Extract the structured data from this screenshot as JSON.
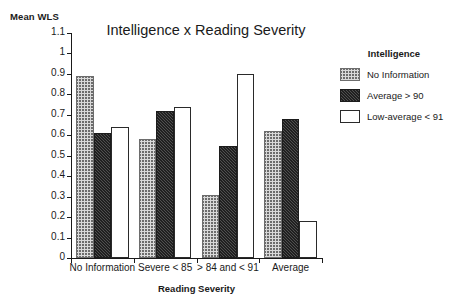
{
  "chart_data": {
    "type": "bar",
    "title": "Intelligence x Reading Severity",
    "xlabel": "Reading Severity",
    "ylabel": "Mean WLS",
    "ylim": [
      0,
      1.1
    ],
    "ytick_step": 0.1,
    "grid": false,
    "legend_position": "right",
    "legend_title": "Intelligence",
    "categories": [
      "No Information",
      "Severe < 85",
      "> 84 and < 91",
      "Average"
    ],
    "ytick_labels": [
      "0",
      "0.1",
      "0.2",
      "0.3",
      "0.4",
      "0.5",
      "0.6",
      "0.7",
      "0.8",
      "0.9",
      "1",
      "1.1"
    ],
    "ytick_values": [
      0,
      0.1,
      0.2,
      0.3,
      0.4,
      0.5,
      0.6,
      0.7,
      0.8,
      0.9,
      1.0,
      1.1
    ],
    "series": [
      {
        "name": "No Information",
        "fill": "hatched-light-gray",
        "color": "#d9d9d9",
        "values": [
          0.89,
          0.58,
          0.31,
          0.62
        ]
      },
      {
        "name": "Average > 90",
        "fill": "solid-dark-gray",
        "color": "#3b3b3b",
        "values": [
          0.61,
          0.72,
          0.55,
          0.68
        ]
      },
      {
        "name": "Low-average < 91",
        "fill": "white-outline",
        "color": "#ffffff",
        "values": [
          0.64,
          0.74,
          0.9,
          0.18
        ]
      }
    ]
  }
}
